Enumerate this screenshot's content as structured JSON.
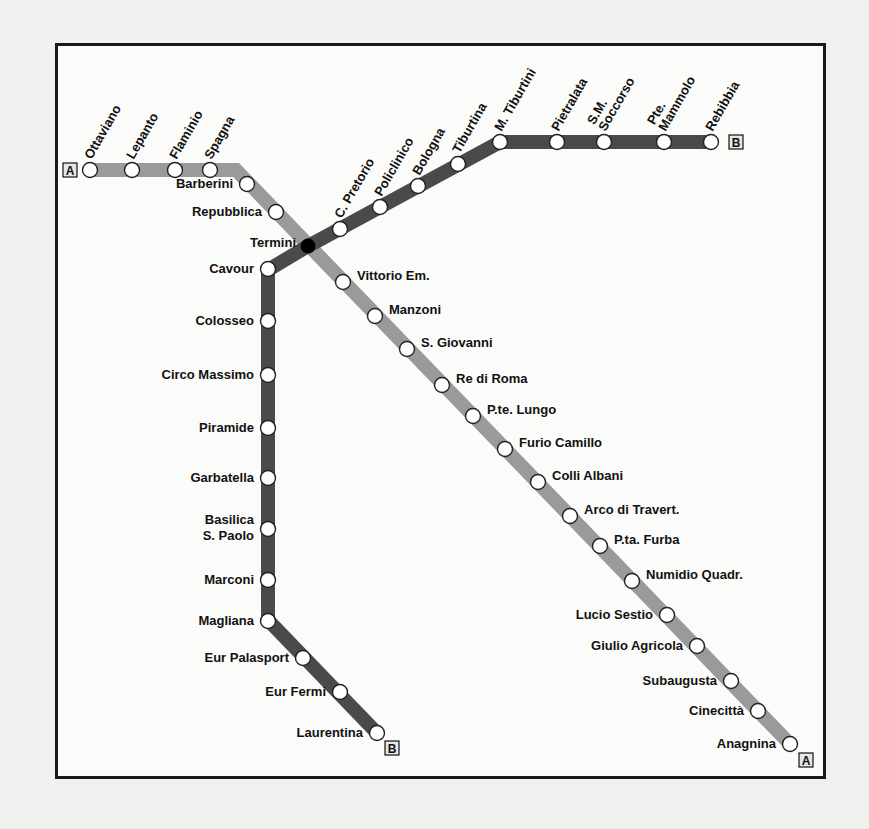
{
  "colors": {
    "line_a": "#9a9a9a",
    "line_b": "#4a4a4a",
    "station_fill": "#ffffff",
    "station_stroke": "#222222",
    "interchange": "#000000",
    "frame": "#1a1a1a",
    "background": "#fbfbf9"
  },
  "lines": {
    "A": {
      "name": "Line A",
      "terminus_badge_start": "A",
      "terminus_badge_end": "A",
      "path": [
        [
          90,
          170
        ],
        [
          236,
          170
        ],
        [
          790,
          744
        ]
      ],
      "stations": [
        {
          "name": "Ottaviano",
          "x": 90,
          "y": 170,
          "label_pos": "rot"
        },
        {
          "name": "Lepanto",
          "x": 132,
          "y": 170,
          "label_pos": "rot"
        },
        {
          "name": "Flaminio",
          "x": 175,
          "y": 170,
          "label_pos": "rot"
        },
        {
          "name": "Spagna",
          "x": 210,
          "y": 170,
          "label_pos": "rot"
        },
        {
          "name": "Barberini",
          "x": 247,
          "y": 184,
          "label_pos": "left"
        },
        {
          "name": "Repubblica",
          "x": 276,
          "y": 212,
          "label_pos": "left"
        },
        {
          "name": "Termini",
          "x": 308,
          "y": 246,
          "label_pos": "left",
          "interchange": true
        },
        {
          "name": "Vittorio Em.",
          "x": 343,
          "y": 282,
          "label_pos": "right"
        },
        {
          "name": "Manzoni",
          "x": 375,
          "y": 316,
          "label_pos": "right"
        },
        {
          "name": "S. Giovanni",
          "x": 407,
          "y": 349,
          "label_pos": "right"
        },
        {
          "name": "Re di Roma",
          "x": 442,
          "y": 385,
          "label_pos": "right"
        },
        {
          "name": "P.te. Lungo",
          "x": 473,
          "y": 416,
          "label_pos": "right"
        },
        {
          "name": "Furio Camillo",
          "x": 505,
          "y": 449,
          "label_pos": "right"
        },
        {
          "name": "Colli Albani",
          "x": 538,
          "y": 482,
          "label_pos": "right"
        },
        {
          "name": "Arco di Travert.",
          "x": 570,
          "y": 516,
          "label_pos": "right"
        },
        {
          "name": "P.ta. Furba",
          "x": 600,
          "y": 546,
          "label_pos": "right"
        },
        {
          "name": "Numidio Quadr.",
          "x": 632,
          "y": 581,
          "label_pos": "right"
        },
        {
          "name": "Lucio Sestio",
          "x": 667,
          "y": 615,
          "label_pos": "left"
        },
        {
          "name": "Giulio Agricola",
          "x": 697,
          "y": 646,
          "label_pos": "left"
        },
        {
          "name": "Subaugusta",
          "x": 731,
          "y": 681,
          "label_pos": "left"
        },
        {
          "name": "Cinecittà",
          "x": 758,
          "y": 711,
          "label_pos": "left"
        },
        {
          "name": "Anagnina",
          "x": 790,
          "y": 744,
          "label_pos": "left"
        }
      ]
    },
    "B": {
      "name": "Line B",
      "terminus_badge_start": "B",
      "terminus_badge_end": "B",
      "path": [
        [
          377,
          733
        ],
        [
          268,
          620
        ],
        [
          268,
          270
        ],
        [
          308,
          246
        ],
        [
          500,
          142
        ],
        [
          711,
          142
        ]
      ],
      "stations": [
        {
          "name": "Laurentina",
          "x": 377,
          "y": 733,
          "label_pos": "left"
        },
        {
          "name": "Eur Fermi",
          "x": 340,
          "y": 692,
          "label_pos": "left"
        },
        {
          "name": "Eur Palasport",
          "x": 303,
          "y": 658,
          "label_pos": "left"
        },
        {
          "name": "Magliana",
          "x": 268,
          "y": 621,
          "label_pos": "left"
        },
        {
          "name": "Marconi",
          "x": 268,
          "y": 580,
          "label_pos": "left"
        },
        {
          "name": "Basilica S. Paolo",
          "x": 268,
          "y": 529,
          "label_pos": "left",
          "multiline": [
            "Basilica",
            "S. Paolo"
          ]
        },
        {
          "name": "Garbatella",
          "x": 268,
          "y": 478,
          "label_pos": "left"
        },
        {
          "name": "Piramide",
          "x": 268,
          "y": 428,
          "label_pos": "left"
        },
        {
          "name": "Circo Massimo",
          "x": 268,
          "y": 375,
          "label_pos": "left"
        },
        {
          "name": "Colosseo",
          "x": 268,
          "y": 321,
          "label_pos": "left"
        },
        {
          "name": "Cavour",
          "x": 268,
          "y": 269,
          "label_pos": "left"
        },
        {
          "name": "Termini",
          "x": 308,
          "y": 246,
          "interchange": true
        },
        {
          "name": "C. Pretorio",
          "x": 340,
          "y": 229,
          "label_pos": "rot"
        },
        {
          "name": "Policlinico",
          "x": 380,
          "y": 207,
          "label_pos": "rot"
        },
        {
          "name": "Bologna",
          "x": 418,
          "y": 186,
          "label_pos": "rot"
        },
        {
          "name": "Tiburtina",
          "x": 458,
          "y": 164,
          "label_pos": "rot"
        },
        {
          "name": "M. Tiburtini",
          "x": 500,
          "y": 142,
          "label_pos": "rot"
        },
        {
          "name": "Pietralata",
          "x": 557,
          "y": 142,
          "label_pos": "rot"
        },
        {
          "name": "S.M. Soccorso",
          "x": 604,
          "y": 142,
          "label_pos": "rot",
          "multiline": [
            "S.M.",
            "Soccorso"
          ]
        },
        {
          "name": "Pte. Mammolo",
          "x": 664,
          "y": 142,
          "label_pos": "rot",
          "multiline": [
            "Pte.",
            "Mammolo"
          ]
        },
        {
          "name": "Rebibbia",
          "x": 711,
          "y": 142,
          "label_pos": "rot"
        }
      ]
    }
  },
  "terminus_badges": [
    {
      "label": "A",
      "x": 70,
      "y": 170
    },
    {
      "label": "B",
      "x": 736,
      "y": 142
    },
    {
      "label": "B",
      "x": 392,
      "y": 748
    },
    {
      "label": "A",
      "x": 806,
      "y": 760
    }
  ]
}
